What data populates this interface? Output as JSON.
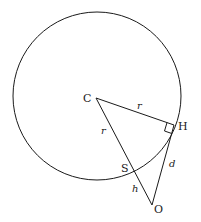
{
  "diagram": {
    "points": {
      "C": {
        "label": "C",
        "x": 96,
        "y": 98
      },
      "H": {
        "label": "H",
        "x": 174,
        "y": 125
      },
      "O": {
        "label": "O",
        "x": 152,
        "y": 205
      },
      "S": {
        "label": "S",
        "x": 132,
        "y": 170
      }
    },
    "circle": {
      "cx": 97,
      "cy": 96,
      "r": 84
    },
    "segment_labels": {
      "CH": "r",
      "CS": "r",
      "SO": "h",
      "HO": "d"
    },
    "right_angle_at": "H",
    "colors": {
      "stroke": "#1a1a1a",
      "background": "#ffffff"
    }
  }
}
